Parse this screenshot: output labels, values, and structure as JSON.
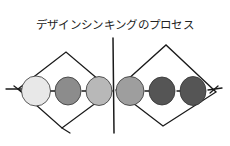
{
  "title": "デザインシンキングのプロセス",
  "diagram": {
    "type": "double-diamond",
    "left_diamond": {
      "circles": [
        {
          "cx": 36,
          "cy": 91,
          "r": 15,
          "fill": "#e8e8e8"
        },
        {
          "cx": 68,
          "cy": 91,
          "r": 14,
          "fill": "#8c8c8c"
        },
        {
          "cx": 99,
          "cy": 91,
          "r": 14,
          "fill": "#b8b8b8"
        }
      ]
    },
    "right_diamond": {
      "circles": [
        {
          "cx": 131,
          "cy": 91,
          "r": 15,
          "fill": "#9e9e9e"
        },
        {
          "cx": 163,
          "cy": 91,
          "r": 14,
          "fill": "#555555"
        },
        {
          "cx": 194,
          "cy": 91,
          "r": 14,
          "fill": "#555555"
        }
      ]
    },
    "colors": {
      "stroke": "#1a1a1a",
      "background": "#ffffff"
    }
  }
}
